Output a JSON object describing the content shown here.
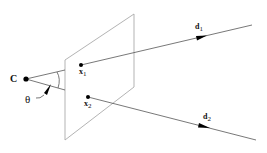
{
  "diagram": {
    "colors": {
      "line": "#555555",
      "plane": "#aaaaaa",
      "point": "#000000",
      "background": "#ffffff"
    },
    "nodes": {
      "camera_center": {
        "label": "C",
        "x": 26,
        "y": 79
      },
      "x1": {
        "label_main": "x",
        "label_sub": "1",
        "x": 81,
        "y": 65
      },
      "x2": {
        "label_main": "x",
        "label_sub": "2",
        "x": 88,
        "y": 97
      }
    },
    "rays": [
      {
        "name": "d1",
        "label_main": "d",
        "label_sub": "1",
        "from": [
          26,
          79
        ],
        "to": [
          252,
          25
        ],
        "arrow_at": [
          200,
          37
        ]
      },
      {
        "name": "d2",
        "label_main": "d",
        "label_sub": "2",
        "from": [
          26,
          79
        ],
        "to": [
          256,
          140
        ],
        "arrow_at": [
          203,
          126
        ]
      }
    ],
    "angle": {
      "label": "θ"
    },
    "plane": {
      "corners": [
        [
          65,
          60
        ],
        [
          134,
          14
        ],
        [
          134,
          87
        ],
        [
          65,
          140
        ]
      ]
    }
  }
}
